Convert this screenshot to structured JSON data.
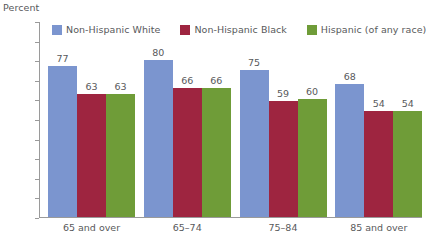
{
  "chart_data": {
    "type": "bar",
    "title": "",
    "subtitle": "",
    "xlabel": "",
    "ylabel": "Percent",
    "ylim": [
      0,
      100
    ],
    "ytick_step": 10,
    "yticks": [
      0,
      10,
      20,
      30,
      40,
      50,
      60,
      70,
      80,
      90,
      100
    ],
    "grid": false,
    "legend_position": "top",
    "categories": [
      "65 and over",
      "65–74",
      "75–84",
      "85 and over"
    ],
    "series": [
      {
        "name": "Non-Hispanic White",
        "color": "#7b95cf",
        "values": [
          77,
          80,
          75,
          68
        ]
      },
      {
        "name": "Non-Hispanic Black",
        "color": "#9e2540",
        "values": [
          63,
          66,
          59,
          54
        ]
      },
      {
        "name": "Hispanic (of any race)",
        "color": "#6f9c38",
        "values": [
          63,
          66,
          60,
          54
        ]
      }
    ]
  },
  "axis": {
    "y_title": "Percent"
  },
  "colors": {
    "axis": "#9a9a9a",
    "text": "#58595b",
    "background": "#ffffff"
  }
}
